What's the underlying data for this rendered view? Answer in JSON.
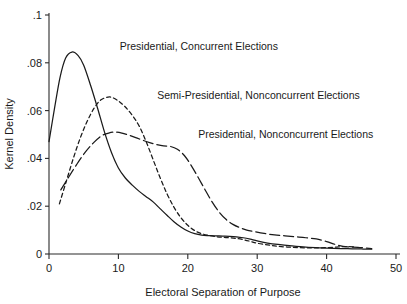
{
  "chart_data": {
    "type": "line",
    "title": "",
    "xlabel": "Electoral Separation of Purpose",
    "ylabel": "Kernel Density",
    "xlim": [
      0,
      50
    ],
    "ylim": [
      0,
      0.1
    ],
    "grid": false,
    "legend_position": "inline-annotations",
    "xticks": [
      "0",
      "10",
      "20",
      "30",
      "40",
      "50"
    ],
    "xtick_values": [
      0,
      10,
      20,
      30,
      40,
      50
    ],
    "yticks": [
      ".1",
      ".08",
      ".06",
      ".04",
      ".02",
      "0"
    ],
    "ytick_values": [
      0.1,
      0.08,
      0.06,
      0.04,
      0.02,
      0
    ],
    "series": [
      {
        "name": "Presidential, Concurrent Elections",
        "style": "solid",
        "label_x": 10.2,
        "label_y": 0.0865,
        "peak_x": 3.3,
        "peak_y": 0.0845,
        "x": [
          0.0,
          0.8,
          1.6,
          2.4,
          3.3,
          4.2,
          5.0,
          6.0,
          7.0,
          8.0,
          9.0,
          10.0,
          11.0,
          12.0,
          13.0,
          14.0,
          15.0,
          16.0,
          17.0,
          18.0,
          19.0,
          20.0,
          21.0,
          22.0,
          23.0,
          24.0,
          25.0,
          26.0,
          27.0,
          28.0,
          29.0,
          30.0,
          31.5,
          33.0,
          35.0,
          37.0,
          39.0,
          41.0,
          43.0,
          45.0,
          46.5
        ],
        "y": [
          0.047,
          0.061,
          0.074,
          0.082,
          0.0845,
          0.083,
          0.079,
          0.0705,
          0.061,
          0.051,
          0.0425,
          0.036,
          0.0318,
          0.0288,
          0.0262,
          0.024,
          0.0218,
          0.019,
          0.0162,
          0.0135,
          0.0113,
          0.0096,
          0.0085,
          0.0079,
          0.0077,
          0.0076,
          0.0075,
          0.0074,
          0.0072,
          0.0068,
          0.0062,
          0.0055,
          0.0046,
          0.004,
          0.0034,
          0.0029,
          0.0026,
          0.0024,
          0.0022,
          0.0021,
          0.002
        ]
      },
      {
        "name": "Semi-Presidential, Nonconcurrent Elections",
        "style": "short-dash",
        "label_x": 15.6,
        "label_y": 0.066,
        "peak_x": 8.8,
        "peak_y": 0.0657,
        "x": [
          1.5,
          2.5,
          3.5,
          4.5,
          5.5,
          6.5,
          7.5,
          8.8,
          10.0,
          11.0,
          12.0,
          13.0,
          14.0,
          15.0,
          16.0,
          17.0,
          18.0,
          19.0,
          20.0,
          21.0,
          22.0,
          23.0,
          24.0,
          25.0,
          26.0,
          27.0,
          28.0,
          29.0,
          30.0,
          31.5,
          33.0,
          35.0,
          37.0,
          39.0,
          41.0,
          42.5,
          44.0
        ],
        "y": [
          0.021,
          0.0305,
          0.04,
          0.0485,
          0.0555,
          0.061,
          0.0645,
          0.0657,
          0.064,
          0.0615,
          0.058,
          0.0535,
          0.047,
          0.0395,
          0.032,
          0.0252,
          0.0196,
          0.0152,
          0.012,
          0.0098,
          0.0085,
          0.0078,
          0.0073,
          0.007,
          0.0068,
          0.0065,
          0.006,
          0.0053,
          0.0045,
          0.0038,
          0.0032,
          0.0028,
          0.0026,
          0.0026,
          0.0028,
          0.0031,
          0.003
        ]
      },
      {
        "name": "Presidential, Nonconcurrent Elections",
        "style": "long-dash",
        "label_x": 21.5,
        "label_y": 0.0498,
        "peak_x": 9.5,
        "peak_y": 0.051,
        "x": [
          1.7,
          2.8,
          4.0,
          5.2,
          6.4,
          7.6,
          8.6,
          9.5,
          10.5,
          11.5,
          12.5,
          13.5,
          14.5,
          15.5,
          16.5,
          17.5,
          18.5,
          19.5,
          20.5,
          21.5,
          22.5,
          23.5,
          24.5,
          25.5,
          26.5,
          27.5,
          28.5,
          29.5,
          31.0,
          32.5,
          34.0,
          35.5,
          37.0,
          38.5,
          40.0,
          41.5,
          43.0,
          44.5,
          46.5
        ],
        "y": [
          0.0268,
          0.032,
          0.0375,
          0.0425,
          0.0465,
          0.0495,
          0.0506,
          0.051,
          0.0506,
          0.0497,
          0.0487,
          0.0476,
          0.0466,
          0.0458,
          0.0452,
          0.045,
          0.0438,
          0.0412,
          0.037,
          0.032,
          0.0268,
          0.0218,
          0.0176,
          0.0145,
          0.0124,
          0.011,
          0.01,
          0.0094,
          0.0086,
          0.008,
          0.0076,
          0.0072,
          0.0068,
          0.0063,
          0.0052,
          0.0038,
          0.003,
          0.0028,
          0.0022
        ]
      }
    ]
  },
  "axes": {
    "xlabel": "Electoral Separation of Purpose",
    "ylabel": "Kernel Density"
  }
}
